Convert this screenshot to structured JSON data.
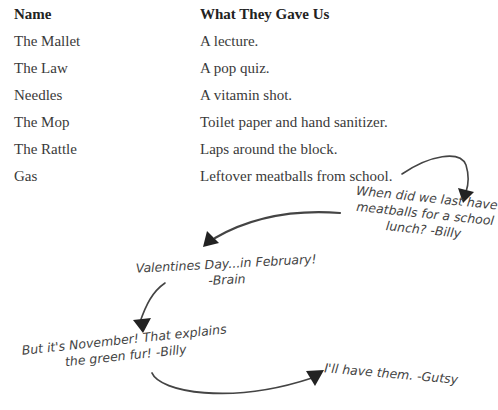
{
  "table": {
    "headers": [
      "Name",
      "What They Gave Us"
    ],
    "rows": [
      [
        "The Mallet",
        "A lecture."
      ],
      [
        "The Law",
        "A pop quiz."
      ],
      [
        "Needles",
        "A vitamin shot."
      ],
      [
        "The Mop",
        "Toilet paper and hand sanitizer."
      ],
      [
        "The Rattle",
        "Laps around the block."
      ],
      [
        "Gas",
        "Leftover meatballs from school."
      ]
    ]
  },
  "notes": {
    "billy_1": [
      "When did we last have",
      "meatballs for a school",
      "lunch? -Billy"
    ],
    "brain": [
      "Valentines Day...in February!",
      "-Brain"
    ],
    "billy_2": [
      "But it's November! That explains",
      "the green fur! -Billy"
    ],
    "gutsy": [
      "I'll have them. -Gutsy"
    ]
  }
}
